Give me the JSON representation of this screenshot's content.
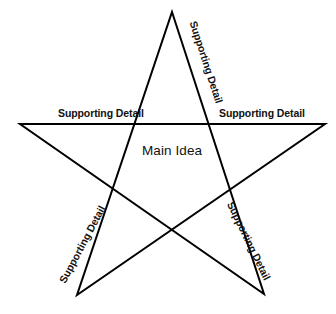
{
  "diagram": {
    "type": "five-pointed-star-organizer",
    "background_color": "#ffffff",
    "stroke_color": "#000000",
    "stroke_width": 2,
    "center": {
      "label": "Main Idea"
    },
    "points": [
      {
        "id": "top-right",
        "label": "Supporting Detail",
        "orientation": "rotated-clockwise",
        "rotation_deg": 72
      },
      {
        "id": "left",
        "label": "Supporting Detail",
        "orientation": "horizontal",
        "rotation_deg": 0
      },
      {
        "id": "right",
        "label": "Supporting Detail",
        "orientation": "horizontal",
        "rotation_deg": 0
      },
      {
        "id": "bottom-left",
        "label": "Supporting Detail",
        "orientation": "rotated-counter-clockwise",
        "rotation_deg": -62
      },
      {
        "id": "bottom-right",
        "label": "Supporting Detail",
        "orientation": "rotated-clockwise",
        "rotation_deg": 64
      }
    ],
    "geometry": {
      "star_path": "M 172,12 L 264,294 L 20,124 L 325,124 L 77,295 Z",
      "vertices": [
        {
          "name": "apex",
          "x": 172,
          "y": 12
        },
        {
          "name": "bottom-right",
          "x": 264,
          "y": 294
        },
        {
          "name": "left",
          "x": 20,
          "y": 124
        },
        {
          "name": "right",
          "x": 325,
          "y": 124
        },
        {
          "name": "bottom-left",
          "x": 77,
          "y": 295
        }
      ]
    }
  }
}
